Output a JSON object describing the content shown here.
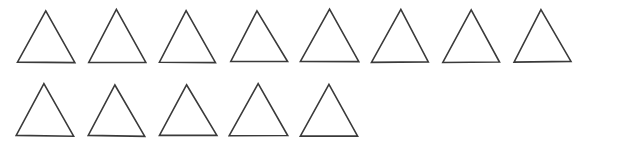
{
  "figure": {
    "shape_name": "triangle",
    "total_count": 13,
    "background_color": "#ffffff",
    "stroke_color": "#3a3a3a",
    "stroke_width": 1.6,
    "canvas": {
      "width": 620,
      "height": 148
    }
  },
  "chart_data": {
    "type": "table",
    "xlabel": "",
    "ylabel": "",
    "categories": [
      "Row 1",
      "Row 2"
    ],
    "values": [
      8,
      5
    ],
    "series": [
      {
        "name": "triangle count per row",
        "values": [
          8,
          5
        ]
      }
    ],
    "total": 13
  },
  "rows": [
    {
      "row_label": "Row 1",
      "count": 8,
      "baseline_y": 62,
      "apex_y": 10,
      "shapes": [
        {
          "id": "triangle-1",
          "left": 17,
          "apex_x": 45,
          "right": 74,
          "width": 57,
          "height": 52
        },
        {
          "id": "triangle-2",
          "left": 88,
          "apex_x": 116,
          "right": 145,
          "width": 57,
          "height": 52
        },
        {
          "id": "triangle-3",
          "left": 159,
          "apex_x": 187,
          "right": 216,
          "width": 57,
          "height": 52
        },
        {
          "id": "triangle-4",
          "left": 230,
          "apex_x": 258,
          "right": 287,
          "width": 57,
          "height": 52
        },
        {
          "id": "triangle-5",
          "left": 301,
          "apex_x": 329,
          "right": 358,
          "width": 57,
          "height": 52
        },
        {
          "id": "triangle-6",
          "left": 372,
          "apex_x": 400,
          "right": 429,
          "width": 57,
          "height": 52
        },
        {
          "id": "triangle-7",
          "left": 443,
          "apex_x": 471,
          "right": 500,
          "width": 57,
          "height": 52
        },
        {
          "id": "triangle-8",
          "left": 514,
          "apex_x": 542,
          "right": 571,
          "width": 57,
          "height": 52
        }
      ]
    },
    {
      "row_label": "Row 2",
      "count": 5,
      "baseline_y": 136,
      "apex_y": 84,
      "shapes": [
        {
          "id": "triangle-9",
          "left": 17,
          "apex_x": 45,
          "right": 74,
          "width": 57,
          "height": 52
        },
        {
          "id": "triangle-10",
          "left": 88,
          "apex_x": 116,
          "right": 145,
          "width": 57,
          "height": 52
        },
        {
          "id": "triangle-11",
          "left": 159,
          "apex_x": 187,
          "right": 216,
          "width": 57,
          "height": 52
        },
        {
          "id": "triangle-12",
          "left": 230,
          "apex_x": 258,
          "right": 287,
          "width": 57,
          "height": 52
        },
        {
          "id": "triangle-13",
          "left": 301,
          "apex_x": 329,
          "right": 358,
          "width": 57,
          "height": 52
        }
      ]
    }
  ]
}
